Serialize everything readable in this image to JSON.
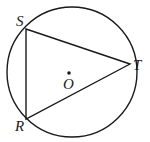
{
  "diagram": {
    "type": "inscribed-triangle-in-circle",
    "colors": {
      "stroke": "#1a1a1a",
      "background": "#ffffff"
    },
    "circle": {
      "center_label": "O",
      "cx": 72,
      "cy": 72,
      "r": 65
    },
    "points": {
      "S": {
        "label": "S",
        "x": 26,
        "y": 29
      },
      "T": {
        "label": "T",
        "x": 130,
        "y": 64
      },
      "R": {
        "label": "R",
        "x": 26,
        "y": 119
      }
    },
    "segments": [
      "ST",
      "TR",
      "RS"
    ],
    "labels": {
      "S": "S",
      "T": "T",
      "R": "R",
      "O": "O"
    }
  }
}
